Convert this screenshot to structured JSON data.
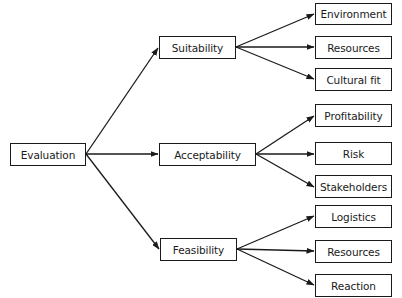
{
  "diagram": {
    "type": "tree",
    "root": {
      "id": "evaluation",
      "label": "Evaluation"
    },
    "branches": [
      {
        "id": "suitability",
        "label": "Suitability",
        "children": [
          {
            "id": "environment",
            "label": "Environment"
          },
          {
            "id": "resources-1",
            "label": "Resources"
          },
          {
            "id": "cultural-fit",
            "label": "Cultural fit"
          }
        ]
      },
      {
        "id": "acceptability",
        "label": "Acceptability",
        "children": [
          {
            "id": "profitability",
            "label": "Profitability"
          },
          {
            "id": "risk",
            "label": "Risk"
          },
          {
            "id": "stakeholders",
            "label": "Stakeholders"
          }
        ]
      },
      {
        "id": "feasibility",
        "label": "Feasibility",
        "children": [
          {
            "id": "logistics",
            "label": "Logistics"
          },
          {
            "id": "resources-2",
            "label": "Resources"
          },
          {
            "id": "reaction",
            "label": "Reaction"
          }
        ]
      }
    ],
    "colors": {
      "stroke": "#1a1a1a",
      "background": "#ffffff",
      "text": "#1a1a1a"
    }
  }
}
